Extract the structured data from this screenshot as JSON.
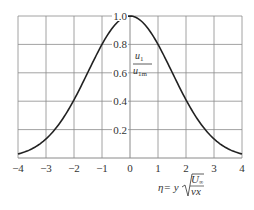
{
  "chart_data": {
    "type": "line",
    "title": "",
    "xlabel": "η = y √(U∞ / νx)",
    "ylabel": "u1 / u1m",
    "xlim": [
      -4,
      4
    ],
    "ylim": [
      0,
      1.0
    ],
    "grid": true,
    "legend": null,
    "x_ticks": [
      "−4",
      "−3",
      "−2",
      "−1",
      "0",
      "1",
      "2",
      "3",
      "4"
    ],
    "y_ticks": [
      "0.2",
      "0.4",
      "0.6",
      "0.8",
      "1.0"
    ],
    "series": [
      {
        "name": "u1/u1m",
        "x": [
          -4,
          -3.5,
          -3,
          -2.5,
          -2,
          -1.5,
          -1,
          -0.5,
          0,
          0.5,
          1,
          1.5,
          2,
          2.5,
          3,
          3.5,
          4
        ],
        "y": [
          0.03,
          0.07,
          0.13,
          0.25,
          0.41,
          0.6,
          0.8,
          0.95,
          1.0,
          0.95,
          0.8,
          0.6,
          0.41,
          0.25,
          0.13,
          0.07,
          0.03
        ]
      }
    ]
  },
  "labels": {
    "ylabel_num": "u",
    "ylabel_num_sub": "1",
    "ylabel_den": "u",
    "ylabel_den_sub": "1m",
    "xlabel_eta": "η= y",
    "xlabel_num": "U",
    "xlabel_num_sub": "∞",
    "xlabel_den": "νx"
  }
}
